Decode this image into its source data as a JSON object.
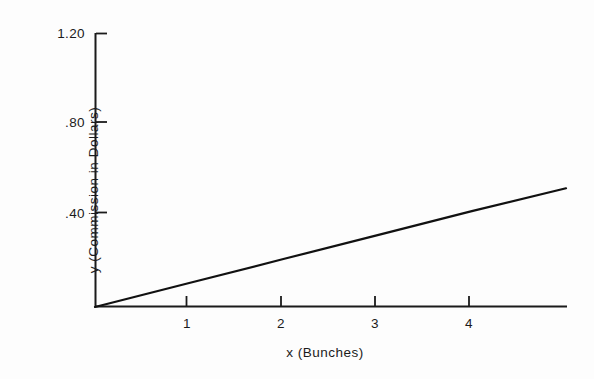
{
  "chart_data": {
    "type": "line",
    "title": "",
    "subtitle": "",
    "xlabel": "x (Bunches)",
    "ylabel": "y (Commission in Dollars)",
    "xlim": [
      0,
      5
    ],
    "ylim": [
      0,
      1.2
    ],
    "xticks": [
      1,
      2,
      3,
      4
    ],
    "xtick_labels": [
      "1",
      "2",
      "3",
      "4"
    ],
    "yticks": [
      0.4,
      0.8,
      1.2
    ],
    "ytick_labels": [
      ".40",
      ".80",
      "1.20"
    ],
    "grid": false,
    "legend": null,
    "legend_position": "none",
    "annotations": [],
    "series": [
      {
        "name": "Commission",
        "x": [
          0,
          1,
          2,
          3,
          4,
          5
        ],
        "values": [
          0,
          0.105,
          0.21,
          0.315,
          0.42,
          0.52
        ],
        "color": "#111111",
        "line_width": 2.2,
        "marker": "none"
      }
    ]
  },
  "axes": {
    "y_top_tick_label": "1.20",
    "y_mid_tick_label": ".80",
    "y_low_tick_label": ".40",
    "x_tick_1": "1",
    "x_tick_2": "2",
    "x_tick_3": "3",
    "x_tick_4": "4",
    "x_title": "x (Bunches)",
    "y_title": "y (Commission in Dollars)"
  },
  "colors": {
    "background": "#fdfdfd",
    "ink": "#1b1b1b",
    "data_line": "#111111"
  }
}
